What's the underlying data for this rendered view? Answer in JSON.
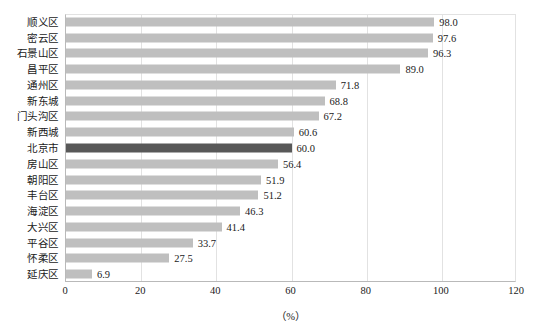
{
  "chart_data": {
    "type": "bar",
    "orientation": "horizontal",
    "title": "",
    "subtitle": "",
    "xlabel": "（%）",
    "ylabel": "",
    "xlim": [
      0,
      120
    ],
    "xticks": [
      0,
      20,
      40,
      60,
      80,
      100,
      120
    ],
    "grid": true,
    "legend": null,
    "categories": [
      "顺义区",
      "密云区",
      "石景山区",
      "昌平区",
      "通州区",
      "新东城",
      "门头沟区",
      "新西城",
      "北京市",
      "房山区",
      "朝阳区",
      "丰台区",
      "海淀区",
      "大兴区",
      "平谷区",
      "怀柔区",
      "延庆区"
    ],
    "values": [
      98.0,
      97.6,
      96.3,
      89.0,
      71.8,
      68.8,
      67.2,
      60.6,
      60.0,
      56.4,
      51.9,
      51.2,
      46.3,
      41.4,
      33.7,
      27.5,
      6.9
    ],
    "value_labels": [
      "98.0",
      "97.6",
      "96.3",
      "89.0",
      "71.8",
      "68.8",
      "67.2",
      "60.6",
      "60.0",
      "56.4",
      "51.9",
      "51.2",
      "46.3",
      "41.4",
      "33.7",
      "27.5",
      "6.9"
    ],
    "highlight_index": 8,
    "colors": {
      "bar": "#bfbfbf",
      "bar_highlight": "#585858",
      "gridline": "#e2e2e2",
      "axis": "#b9b9b9",
      "text": "#1a1a1a",
      "background": "#ffffff"
    }
  }
}
